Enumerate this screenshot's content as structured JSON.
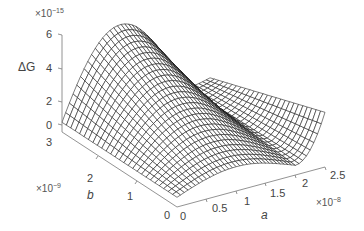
{
  "chart_data": {
    "type": "surface",
    "title": "",
    "zlabel": "ΔG",
    "xlabel": "a",
    "ylabel": "b",
    "z_exponent": "×10⁻¹⁵",
    "x_exponent": "×10⁻⁸",
    "y_exponent": "×10⁻⁹",
    "z_ticks": [
      "0",
      "2",
      "4",
      "6"
    ],
    "x_ticks": [
      "0",
      "0.5",
      "1",
      "1.5",
      "2",
      "2.5"
    ],
    "y_ticks": [
      "0",
      "1",
      "2",
      "3"
    ],
    "xlim": [
      0,
      2.5e-08
    ],
    "ylim": [
      0,
      3e-09
    ],
    "zlim": [
      -1e-15,
      6e-15
    ],
    "grid": false,
    "sample_points": [
      {
        "a": 0,
        "b": 3e-09,
        "dG": 0.0
      },
      {
        "a": 5e-09,
        "b": 3e-09,
        "dG": 4.5e-15
      },
      {
        "a": 1e-08,
        "b": 3e-09,
        "dG": 5.8e-15
      },
      {
        "a": 1.5e-08,
        "b": 3e-09,
        "dG": 5.2e-15
      },
      {
        "a": 2e-08,
        "b": 3e-09,
        "dG": 3.5e-15
      },
      {
        "a": 2.5e-08,
        "b": 3e-09,
        "dG": 1.5e-15
      },
      {
        "a": 0,
        "b": 0,
        "dG": 0.0
      },
      {
        "a": 1e-08,
        "b": 0,
        "dG": 1.5e-15
      },
      {
        "a": 2e-08,
        "b": 0,
        "dG": 0.0
      },
      {
        "a": 2.5e-08,
        "b": 0,
        "dG": 3e-15
      }
    ]
  },
  "labels": {
    "z": "ΔG",
    "x": "a",
    "y": "b",
    "z_exp": "×10",
    "z_exp_sup": "−15",
    "x_exp": "×10",
    "x_exp_sup": "−8",
    "y_exp": "×10",
    "y_exp_sup": "−9"
  },
  "ticks": {
    "z": [
      "6",
      "4",
      "2",
      "0"
    ],
    "b": [
      "3",
      "2",
      "1",
      "0"
    ],
    "a": [
      "0",
      "0.5",
      "1",
      "1.5",
      "2",
      "2.5"
    ]
  }
}
